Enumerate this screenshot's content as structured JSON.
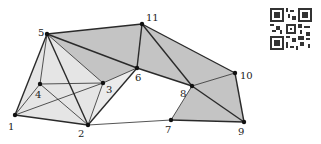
{
  "diagram": {
    "type": "simplicial-complex",
    "vertices": [
      {
        "id": "1",
        "x": 15,
        "y": 115,
        "label": "1",
        "lx": 8,
        "ly": 130
      },
      {
        "id": "2",
        "x": 88,
        "y": 125,
        "label": "2",
        "lx": 78,
        "ly": 137
      },
      {
        "id": "3",
        "x": 103,
        "y": 83,
        "label": "3",
        "lx": 106,
        "ly": 93
      },
      {
        "id": "4",
        "x": 40,
        "y": 84,
        "label": "4",
        "lx": 35,
        "ly": 98
      },
      {
        "id": "5",
        "x": 47,
        "y": 34,
        "label": "5",
        "lx": 38,
        "ly": 36
      },
      {
        "id": "6",
        "x": 137,
        "y": 68,
        "label": "6",
        "lx": 135,
        "ly": 81
      },
      {
        "id": "7",
        "x": 171,
        "y": 120,
        "label": "7",
        "lx": 165,
        "ly": 133
      },
      {
        "id": "8",
        "x": 192,
        "y": 86,
        "label": "8",
        "lx": 180,
        "ly": 97
      },
      {
        "id": "9",
        "x": 244,
        "y": 122,
        "label": "9",
        "lx": 238,
        "ly": 135
      },
      {
        "id": "10",
        "x": 235,
        "y": 73,
        "label": "10",
        "lx": 240,
        "ly": 79
      },
      {
        "id": "11",
        "x": 142,
        "y": 24,
        "label": "11",
        "lx": 146,
        "ly": 21
      }
    ],
    "faces_dark": [
      [
        "5",
        "11",
        "6"
      ],
      [
        "11",
        "6",
        "8"
      ],
      [
        "11",
        "8",
        "10"
      ],
      [
        "8",
        "10",
        "9"
      ],
      [
        "8",
        "7",
        "9"
      ],
      [
        "5",
        "6",
        "3"
      ]
    ],
    "faces_light": [
      [
        "1",
        "5",
        "4"
      ],
      [
        "4",
        "5",
        "3"
      ],
      [
        "1",
        "4",
        "2"
      ],
      [
        "4",
        "3",
        "2"
      ],
      [
        "5",
        "3",
        "2"
      ],
      [
        "2",
        "3",
        "6"
      ],
      [
        "1",
        "5",
        "2"
      ]
    ],
    "edges_bold": [
      [
        "1",
        "5"
      ],
      [
        "5",
        "2"
      ],
      [
        "1",
        "2"
      ],
      [
        "2",
        "6"
      ],
      [
        "5",
        "6"
      ],
      [
        "5",
        "11"
      ],
      [
        "11",
        "6"
      ],
      [
        "11",
        "8"
      ],
      [
        "6",
        "8"
      ],
      [
        "11",
        "10"
      ],
      [
        "8",
        "9"
      ],
      [
        "10",
        "9"
      ],
      [
        "7",
        "9"
      ]
    ],
    "edges_thin": [
      [
        "1",
        "4"
      ],
      [
        "4",
        "5"
      ],
      [
        "4",
        "3"
      ],
      [
        "4",
        "2"
      ],
      [
        "1",
        "3"
      ],
      [
        "3",
        "6"
      ],
      [
        "5",
        "3"
      ],
      [
        "2",
        "3"
      ],
      [
        "2",
        "7"
      ],
      [
        "8",
        "10"
      ],
      [
        "8",
        "7"
      ]
    ],
    "colors": {
      "dark_fill": "#c4c4c4",
      "light_fill": "#e2e2e2",
      "edge": "#2a2a2a",
      "vertex": "#111111"
    }
  },
  "qr_code": {
    "label": "qr-code"
  }
}
